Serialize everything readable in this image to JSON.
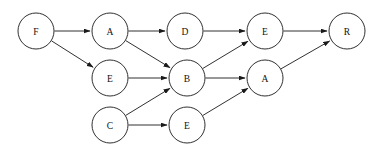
{
  "diagram": {
    "width": 374,
    "height": 153,
    "background_color": "#ffffff",
    "stroke_color": "#1a1a1a",
    "node_fill_color": "#ffffff",
    "node_radius": 18,
    "nodes": [
      {
        "id": "n0",
        "label": "F",
        "cx": 36,
        "cy": 31,
        "name": "node-f-source"
      },
      {
        "id": "n1",
        "label": "A",
        "cx": 110,
        "cy": 31,
        "name": "node-a-top"
      },
      {
        "id": "n2",
        "label": "D",
        "cx": 185,
        "cy": 31,
        "name": "node-d-top"
      },
      {
        "id": "n3",
        "label": "E",
        "cx": 265,
        "cy": 31,
        "name": "node-e-top"
      },
      {
        "id": "n4",
        "label": "R",
        "cx": 347,
        "cy": 31,
        "name": "node-r-sink"
      },
      {
        "id": "n5",
        "label": "E",
        "cx": 110,
        "cy": 78,
        "name": "node-e-middle-left"
      },
      {
        "id": "n6",
        "label": "B",
        "cx": 187,
        "cy": 78,
        "name": "node-b-middle"
      },
      {
        "id": "n7",
        "label": "A",
        "cx": 265,
        "cy": 78,
        "name": "node-a-middle-right"
      },
      {
        "id": "n8",
        "label": "C",
        "cx": 110,
        "cy": 125,
        "name": "node-c-bottom"
      },
      {
        "id": "n9",
        "label": "E",
        "cx": 187,
        "cy": 125,
        "name": "node-e-bottom"
      }
    ],
    "edges": [
      {
        "from": "n0",
        "to": "n1",
        "name": "edge-f-to-a-top"
      },
      {
        "from": "n0",
        "to": "n5",
        "name": "edge-f-to-e-middle-left"
      },
      {
        "from": "n1",
        "to": "n2",
        "name": "edge-a-top-to-d"
      },
      {
        "from": "n1",
        "to": "n6",
        "name": "edge-a-top-to-b"
      },
      {
        "from": "n2",
        "to": "n3",
        "name": "edge-d-to-e-top"
      },
      {
        "from": "n5",
        "to": "n6",
        "name": "edge-e-middle-left-to-b"
      },
      {
        "from": "n8",
        "to": "n6",
        "name": "edge-c-to-b"
      },
      {
        "from": "n8",
        "to": "n9",
        "name": "edge-c-to-e-bottom"
      },
      {
        "from": "n6",
        "to": "n3",
        "name": "edge-b-to-e-top"
      },
      {
        "from": "n6",
        "to": "n7",
        "name": "edge-b-to-a-middle-right"
      },
      {
        "from": "n9",
        "to": "n7",
        "name": "edge-e-bottom-to-a-middle-right"
      },
      {
        "from": "n3",
        "to": "n4",
        "name": "edge-e-top-to-r"
      },
      {
        "from": "n7",
        "to": "n4",
        "name": "edge-a-middle-right-to-r"
      }
    ]
  }
}
